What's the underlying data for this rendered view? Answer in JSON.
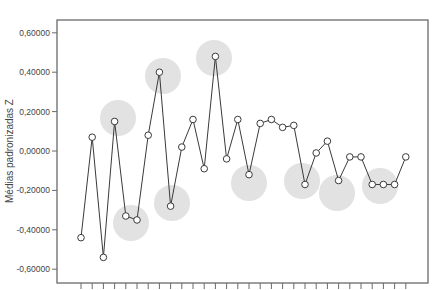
{
  "chart_data": {
    "type": "line",
    "title": "",
    "xlabel": "",
    "ylabel": "Médias padronizadas Z",
    "ylim": [
      -0.68,
      0.67
    ],
    "yticks": [
      {
        "value": 0.6,
        "label": "0,60000"
      },
      {
        "value": 0.4,
        "label": "0,40000"
      },
      {
        "value": 0.2,
        "label": "0,20000"
      },
      {
        "value": 0.0,
        "label": "0,00000"
      },
      {
        "value": -0.2,
        "label": "-0,20000"
      },
      {
        "value": -0.4,
        "label": "-0,40000"
      },
      {
        "value": -0.6,
        "label": "-0,60000"
      }
    ],
    "grid": false,
    "legend": null,
    "x": [
      1,
      2,
      3,
      4,
      5,
      6,
      7,
      8,
      9,
      10,
      11,
      12,
      13,
      14,
      15,
      16,
      17,
      18,
      19,
      20,
      21,
      22,
      23,
      24,
      25,
      26,
      27,
      28,
      29,
      30
    ],
    "series": [
      {
        "name": "Médias padronizadas Z",
        "values": [
          -0.44,
          0.07,
          -0.54,
          0.15,
          -0.33,
          -0.35,
          0.08,
          0.4,
          -0.28,
          0.02,
          0.16,
          -0.09,
          0.48,
          -0.04,
          0.16,
          -0.12,
          0.14,
          0.16,
          0.12,
          0.13,
          -0.17,
          -0.01,
          0.05,
          -0.15,
          -0.03,
          -0.03,
          -0.17,
          -0.17,
          -0.17,
          -0.03
        ]
      }
    ],
    "highlighted_regions": [
      {
        "near_points": [
          4
        ],
        "cx": 118,
        "cy": 118
      },
      {
        "near_points": [
          5,
          6
        ],
        "cx": 131,
        "cy": 223
      },
      {
        "near_points": [
          8
        ],
        "cx": 163,
        "cy": 76
      },
      {
        "near_points": [
          9
        ],
        "cx": 172,
        "cy": 203
      },
      {
        "near_points": [
          13
        ],
        "cx": 214,
        "cy": 58
      },
      {
        "near_points": [
          16
        ],
        "cx": 249,
        "cy": 183
      },
      {
        "near_points": [
          21
        ],
        "cx": 302,
        "cy": 181
      },
      {
        "near_points": [
          24
        ],
        "cx": 337,
        "cy": 193
      },
      {
        "near_points": [
          28
        ],
        "cx": 380,
        "cy": 186
      }
    ],
    "colors": {
      "line": "#3a3a3a",
      "marker_fill": "#ffffff",
      "highlight": "#e2e2e2",
      "frame": "#6a6a6a"
    }
  }
}
